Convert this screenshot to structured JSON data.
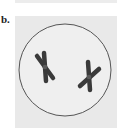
{
  "figure": {
    "panel_label": "b.",
    "colors": {
      "panel_background": "#e9e9e9",
      "cell_fill": "#efefef",
      "cell_outline": "#555555",
      "chromosome": "#3a3a3a",
      "centromere": "#5a5a5a"
    },
    "cell": {
      "shape": "circle",
      "chromosome_count": 2
    },
    "chromosomes": [
      {
        "id": "chromosome-1",
        "position": "upper-left"
      },
      {
        "id": "chromosome-2",
        "position": "lower-right"
      }
    ]
  }
}
